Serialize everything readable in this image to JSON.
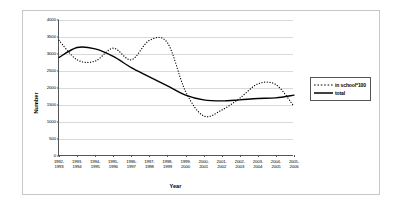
{
  "chart_data": {
    "type": "line",
    "title": "",
    "xlabel": "Year",
    "ylabel": "Number",
    "ylim": [
      0,
      4000
    ],
    "yticks": [
      0,
      500,
      1000,
      1500,
      2000,
      2500,
      3000,
      3500,
      4000
    ],
    "grid": true,
    "legend_position": "right",
    "categories": [
      "1992-\n1993",
      "1993-\n1994",
      "1994-\n1995",
      "1995-\n1996",
      "1996-\n1997",
      "1997-\n1998",
      "1998-\n1999",
      "1999-\n2000",
      "2000-\n2001",
      "2001-\n2002",
      "2002-\n2003",
      "2003-\n2004",
      "2004-\n2005",
      "2005-\n2006"
    ],
    "categories_top": [
      "1992-",
      "1993-",
      "1994-",
      "1995-",
      "1996-",
      "1997-",
      "1998-",
      "1999-",
      "2000-",
      "2001-",
      "2002-",
      "2003-",
      "2004-",
      "2005-"
    ],
    "categories_bottom": [
      "1993",
      "1994",
      "1995",
      "1996",
      "1997",
      "1998",
      "1999",
      "2000",
      "2001",
      "2002",
      "2003",
      "2004",
      "2005",
      "2006"
    ],
    "series": [
      {
        "name": "in school*100",
        "style": "dotted",
        "color": "#000000",
        "values": [
          3400,
          2830,
          2790,
          3170,
          2830,
          3400,
          3330,
          1900,
          1180,
          1350,
          1700,
          2120,
          2100,
          1460
        ]
      },
      {
        "name": "total",
        "style": "solid",
        "color": "#000000",
        "values": [
          2900,
          3190,
          3150,
          2930,
          2600,
          2330,
          2060,
          1790,
          1650,
          1620,
          1650,
          1690,
          1710,
          1790
        ]
      }
    ]
  },
  "legend": {
    "items": [
      {
        "label": "in school*100",
        "style": "dotted"
      },
      {
        "label": "total",
        "style": "solid"
      }
    ]
  }
}
